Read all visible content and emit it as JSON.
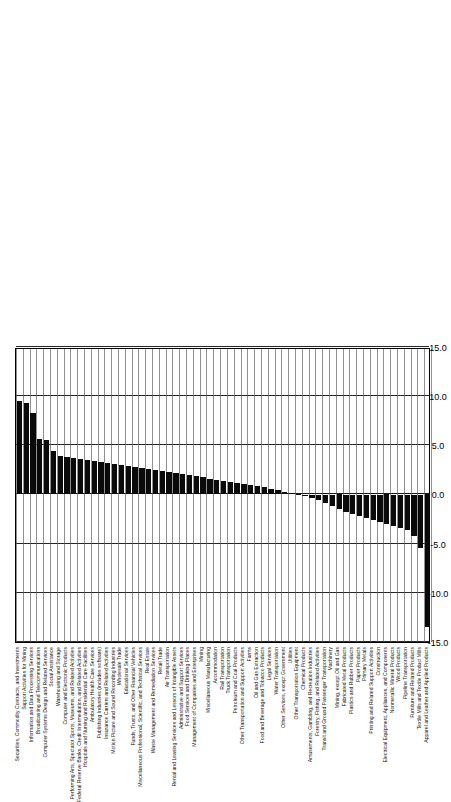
{
  "chart": {
    "type": "bar",
    "orientation": "horizontal",
    "title": "",
    "xlabel": "",
    "ylabel": "",
    "axis_ticks": [
      "-15.0",
      "-10.0",
      "-5.0",
      "0.0",
      "5.0",
      "10.0",
      "15.0"
    ],
    "xlim": [
      -15.0,
      15.0
    ],
    "grid": true,
    "bar_color": "#0a0a0a"
  },
  "chart_data": {
    "type": "bar",
    "title": "",
    "xlabel": "",
    "ylabel": "",
    "xlim": [
      -15.0,
      15.0
    ],
    "grid": true,
    "legend": null,
    "orientation": "horizontal",
    "categories": [
      "Securities, Commodity Contracts, and Investments",
      "Support Activities for Mining",
      "Information and Data Processing Services",
      "Broadcasting and Telecommunications",
      "Computer Systems Design and Related Services",
      "Social Assistance",
      "Warehousing and Storage",
      "Computer and Electronic Products",
      "Performing Arts, Spectator Sports, Museums, and Related Activities",
      "Federal Reserve Banks, Credit Intermediation, and Related Activities",
      "Hospitals and Nursing and Residential Care Facilities",
      "Ambulatory Health Care Services",
      "Publishing Industries (includes software)",
      "Insurance Carriers and Related Activities",
      "Motion Picture and Sound Recording Industries",
      "Wholesale Trade",
      "Educational Services",
      "Funds, Trusts, and Other Financial Vehicles",
      "Miscellaneous Professional, Scientific, and Technical Services",
      "Real Estate",
      "Waste Management and Remediation Services",
      "Retail Trade",
      "Air Transportation",
      "Rental and Leasing Services and Lessors of Intangible Assets",
      "Administrative and Support Services",
      "Food Services and Drinking Places",
      "Management of Companies and Enterprises",
      "Mining",
      "Miscellaneous Manufacturing",
      "Accommodation",
      "Rail Transportation",
      "Truck Transportation",
      "Petroleum and Coal Products",
      "Other Transportation and Support Activities",
      "Farms",
      "Oil and Gas Extraction",
      "Food and Beverage and Tobacco Products",
      "Legal Services",
      "Water Transportation",
      "Other Services, except Government",
      "Utilities",
      "Other Transportation Equipment",
      "Chemical Products",
      "Amusements, Gambling, and Recreation Industries",
      "Forestry, Fishing, and Related Activities",
      "Transit and Ground Passenger Transportation",
      "Machinery",
      "Mining, except Oil and Gas",
      "Fabricated Metal Products",
      "Plastics and Rubber Products",
      "Paper Products",
      "Primary Metals",
      "Printing and Related Support Activities",
      "Construction",
      "Electrical Equipment, Appliances, and Components",
      "Nonmetallic Mineral Products",
      "Wood Products",
      "Pipeline Transportation",
      "Furniture and Related Products",
      "Textile Mills and Textile Product Mills",
      "Apparel and Leather and Applied Products"
    ],
    "values": [
      9.5,
      9.3,
      8.3,
      5.6,
      5.5,
      4.4,
      3.9,
      3.8,
      3.7,
      3.6,
      3.5,
      3.4,
      3.3,
      3.2,
      3.1,
      3.0,
      2.9,
      2.8,
      2.7,
      2.6,
      2.5,
      2.4,
      2.3,
      2.2,
      2.1,
      2.0,
      1.9,
      1.8,
      1.6,
      1.5,
      1.4,
      1.3,
      1.2,
      1.1,
      1.0,
      0.9,
      0.8,
      0.6,
      0.5,
      0.3,
      0.1,
      -0.1,
      -0.2,
      -0.4,
      -0.6,
      -0.9,
      -1.2,
      -1.5,
      -1.8,
      -2.0,
      -2.2,
      -2.4,
      -2.6,
      -2.8,
      -3.0,
      -3.2,
      -3.4,
      -3.6,
      -4.2,
      -5.4,
      -13.5
    ]
  }
}
